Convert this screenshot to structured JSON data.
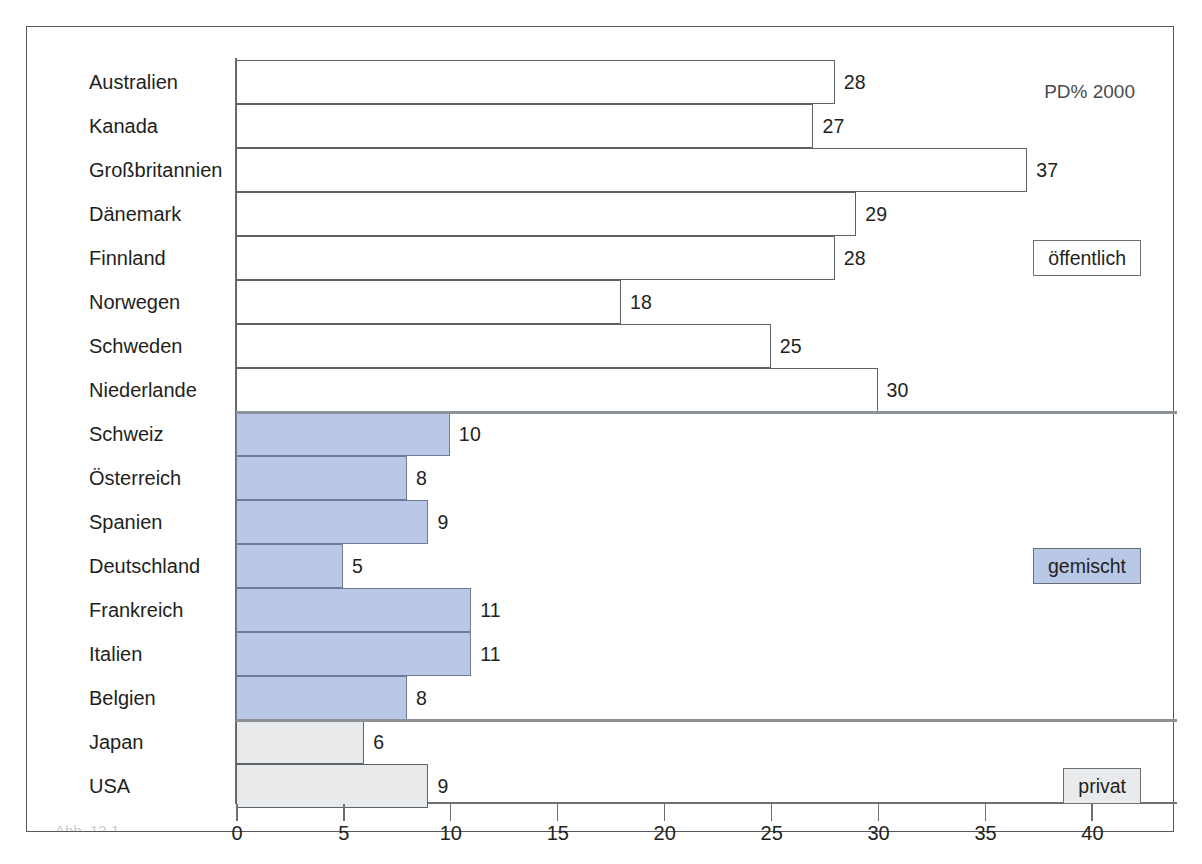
{
  "note": "PD% 2000",
  "legend": [
    {
      "key": "public",
      "label": "öffentlich",
      "color": "#ffffff"
    },
    {
      "key": "mixed",
      "label": "gemischt",
      "color": "#b9c8e6"
    },
    {
      "key": "private",
      "label": "privat",
      "color": "#e8eaec"
    }
  ],
  "caption": "Abb. 12.1   ",
  "chart_data": {
    "type": "bar",
    "orientation": "horizontal",
    "title": "",
    "subtitle": "",
    "annotations": [
      "PD% 2000"
    ],
    "xlabel": "",
    "ylabel": "",
    "xlim": [
      0,
      44
    ],
    "xticks": [
      0,
      5,
      10,
      15,
      20,
      25,
      30,
      35,
      40
    ],
    "xticklabels": [
      "0",
      "5",
      "10",
      "15",
      "20",
      "25",
      "30",
      "35",
      "40"
    ],
    "grid": false,
    "legend_position": "right",
    "legend_entries": [
      "öffentlich",
      "gemischt",
      "privat"
    ],
    "groups": [
      {
        "name": "öffentlich",
        "color": "#ffffff",
        "categories": [
          "Australien",
          "Kanada",
          "Großbritannien",
          "Dänemark",
          "Finnland",
          "Norwegen",
          "Schweden",
          "Niederlande"
        ],
        "values": [
          28,
          27,
          37,
          29,
          28,
          18,
          25,
          30
        ]
      },
      {
        "name": "gemischt",
        "color": "#b9c8e6",
        "categories": [
          "Schweiz",
          "Österreich",
          "Spanien",
          "Deutschland",
          "Frankreich",
          "Italien",
          "Belgien"
        ],
        "values": [
          10,
          8,
          9,
          5,
          11,
          11,
          8
        ]
      },
      {
        "name": "privat",
        "color": "#e8eaec",
        "categories": [
          "Japan",
          "USA"
        ],
        "values": [
          6,
          9
        ]
      }
    ],
    "categories": [
      "Australien",
      "Kanada",
      "Großbritannien",
      "Dänemark",
      "Finnland",
      "Norwegen",
      "Schweden",
      "Niederlande",
      "Schweiz",
      "Österreich",
      "Spanien",
      "Deutschland",
      "Frankreich",
      "Italien",
      "Belgien",
      "Japan",
      "USA"
    ],
    "values": [
      28,
      27,
      37,
      29,
      28,
      18,
      25,
      30,
      10,
      8,
      9,
      5,
      11,
      11,
      8,
      6,
      9
    ]
  }
}
